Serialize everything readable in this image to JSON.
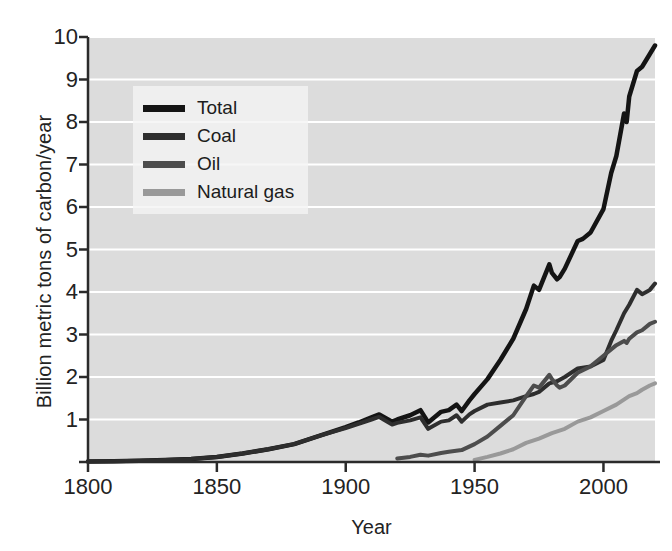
{
  "chart_data": {
    "type": "line",
    "title": "",
    "subtitle": "",
    "xlabel": "Year",
    "ylabel": "Billion metric tons of carbon/year",
    "xlim": [
      1800,
      2020
    ],
    "ylim": [
      0,
      10
    ],
    "xticks": [
      1800,
      1850,
      1900,
      1950,
      2000
    ],
    "xtick_labels": [
      "1800",
      "1850",
      "1900",
      "1950",
      "2000"
    ],
    "yticks": [
      0,
      1,
      2,
      3,
      4,
      5,
      6,
      7,
      8,
      9,
      10
    ],
    "ytick_labels": [
      "",
      "1",
      "2",
      "3",
      "4",
      "5",
      "6",
      "7",
      "8",
      "9",
      "10"
    ],
    "grid": "horizontal-white-on-gray",
    "plot_background": "#dcdcdc",
    "legend_position": "upper-left-inside",
    "annotations": [],
    "series": [
      {
        "name": "Total",
        "color": "#141414",
        "linewidth": 4.5,
        "x": [
          1800,
          1810,
          1820,
          1830,
          1840,
          1850,
          1860,
          1870,
          1880,
          1890,
          1900,
          1905,
          1910,
          1913,
          1918,
          1920,
          1925,
          1929,
          1932,
          1937,
          1940,
          1943,
          1945,
          1948,
          1950,
          1955,
          1960,
          1965,
          1970,
          1973,
          1975,
          1979,
          1980,
          1982,
          1983,
          1985,
          1990,
          1992,
          1995,
          2000,
          2003,
          2005,
          2008,
          2009,
          2010,
          2013,
          2015,
          2018,
          2020
        ],
        "y": [
          0.01,
          0.02,
          0.03,
          0.05,
          0.07,
          0.12,
          0.2,
          0.3,
          0.42,
          0.62,
          0.82,
          0.93,
          1.05,
          1.12,
          0.95,
          1.0,
          1.1,
          1.22,
          0.93,
          1.18,
          1.22,
          1.35,
          1.2,
          1.45,
          1.6,
          1.95,
          2.4,
          2.9,
          3.6,
          4.15,
          4.05,
          4.65,
          4.45,
          4.3,
          4.35,
          4.55,
          5.2,
          5.25,
          5.4,
          5.95,
          6.8,
          7.2,
          8.2,
          8.0,
          8.6,
          9.2,
          9.3,
          9.6,
          9.8
        ]
      },
      {
        "name": "Coal",
        "color": "#2e2e2e",
        "linewidth": 4,
        "x": [
          1800,
          1810,
          1820,
          1830,
          1840,
          1850,
          1860,
          1870,
          1880,
          1890,
          1900,
          1905,
          1910,
          1913,
          1918,
          1920,
          1925,
          1929,
          1932,
          1937,
          1940,
          1943,
          1945,
          1948,
          1950,
          1955,
          1960,
          1965,
          1970,
          1973,
          1975,
          1979,
          1982,
          1985,
          1990,
          1995,
          2000,
          2003,
          2005,
          2008,
          2010,
          2013,
          2015,
          2018,
          2020
        ],
        "y": [
          0.01,
          0.02,
          0.03,
          0.05,
          0.07,
          0.12,
          0.2,
          0.3,
          0.42,
          0.62,
          0.8,
          0.9,
          1.0,
          1.06,
          0.88,
          0.92,
          0.98,
          1.05,
          0.78,
          0.95,
          0.98,
          1.1,
          0.95,
          1.12,
          1.2,
          1.35,
          1.4,
          1.45,
          1.55,
          1.6,
          1.65,
          1.85,
          1.9,
          2.0,
          2.2,
          2.25,
          2.4,
          2.85,
          3.1,
          3.5,
          3.7,
          4.05,
          3.95,
          4.05,
          4.2
        ]
      },
      {
        "name": "Oil",
        "color": "#4d4d4d",
        "linewidth": 4,
        "x": [
          1920,
          1925,
          1929,
          1932,
          1937,
          1940,
          1945,
          1950,
          1955,
          1960,
          1965,
          1970,
          1973,
          1975,
          1979,
          1980,
          1982,
          1983,
          1985,
          1990,
          1995,
          2000,
          2005,
          2008,
          2009,
          2010,
          2013,
          2015,
          2018,
          2020
        ],
        "y": [
          0.08,
          0.12,
          0.17,
          0.15,
          0.21,
          0.24,
          0.28,
          0.42,
          0.6,
          0.85,
          1.1,
          1.55,
          1.8,
          1.75,
          2.05,
          1.95,
          1.8,
          1.75,
          1.8,
          2.1,
          2.25,
          2.5,
          2.75,
          2.85,
          2.8,
          2.9,
          3.05,
          3.1,
          3.25,
          3.3
        ]
      },
      {
        "name": "Natural gas",
        "color": "#999999",
        "linewidth": 4,
        "x": [
          1950,
          1955,
          1960,
          1965,
          1970,
          1975,
          1980,
          1985,
          1990,
          1995,
          2000,
          2005,
          2010,
          2013,
          2015,
          2018,
          2020
        ],
        "y": [
          0.05,
          0.12,
          0.2,
          0.3,
          0.45,
          0.55,
          0.68,
          0.78,
          0.95,
          1.05,
          1.2,
          1.35,
          1.55,
          1.62,
          1.7,
          1.8,
          1.85
        ]
      }
    ]
  },
  "legend": {
    "items": [
      {
        "label": "Total",
        "color": "#141414"
      },
      {
        "label": "Coal",
        "color": "#2e2e2e"
      },
      {
        "label": "Oil",
        "color": "#4d4d4d"
      },
      {
        "label": "Natural gas",
        "color": "#999999"
      }
    ]
  },
  "axes": {
    "x_title": "Year",
    "y_title": "Billion metric tons of carbon/year"
  }
}
